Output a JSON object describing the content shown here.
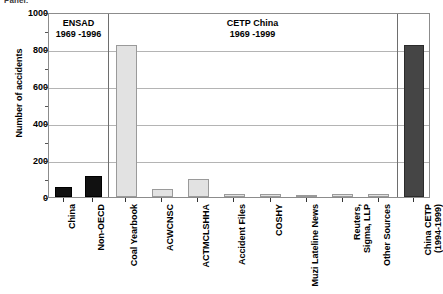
{
  "figure": {
    "top_fragment": "Panel:",
    "y_axis_title": "Number of accidents",
    "panels": [
      {
        "id": "ensad",
        "line1": "ENSAD",
        "line2": "1969 -1996"
      },
      {
        "id": "cetp-china",
        "line1": "CETP China",
        "line2": "1969 -1999"
      },
      {
        "id": "china-cetp",
        "line1": "",
        "line2": ""
      }
    ],
    "y_ticks": [
      "0",
      "200",
      "400",
      "600",
      "800",
      "1000"
    ]
  },
  "chart_data": {
    "type": "bar",
    "title": "",
    "xlabel": "",
    "ylabel": "Number of accidents",
    "ylim": [
      0,
      1000
    ],
    "yticks": [
      0,
      200,
      400,
      600,
      800,
      1000
    ],
    "grid": true,
    "legend": "none",
    "panel_dividers": [
      "ENSAD 1969 -1996 | CETP China 1969 -1999",
      "CETP China 1969 -1999 | China CETP (1994-1999)"
    ],
    "categories": [
      "China",
      "Non-OECD",
      "Coal Yearbook",
      "ACWCNSC",
      "ACTMCLSHHA",
      "Accident Files",
      "COSHY",
      "Muzi Lateline News",
      "Reuters, Sigma, LLP",
      "Other Sources",
      "China CETP (1994-1999)"
    ],
    "values": [
      52,
      112,
      820,
      45,
      100,
      18,
      16,
      6,
      16,
      14,
      820
    ],
    "bar_styles": [
      "black",
      "black",
      "light",
      "light",
      "light",
      "light",
      "light",
      "light",
      "light",
      "light",
      "dark"
    ],
    "groups": [
      {
        "name": "ENSAD 1969 -1996",
        "categories": [
          "China",
          "Non-OECD"
        ]
      },
      {
        "name": "CETP China 1969 -1999",
        "categories": [
          "Coal Yearbook",
          "ACWCNSC",
          "ACTMCLSHHA",
          "Accident Files",
          "COSHY",
          "Muzi Lateline News",
          "Reuters, Sigma, LLP",
          "Other Sources"
        ]
      },
      {
        "name": "China CETP (1994-1999)",
        "categories": [
          "China CETP (1994-1999)"
        ]
      }
    ],
    "x_tick_labels": [
      {
        "line1": "China",
        "line2": ""
      },
      {
        "line1": "Non-OECD",
        "line2": ""
      },
      {
        "line1": "Coal Yearbook",
        "line2": ""
      },
      {
        "line1": "ACWCNSC",
        "line2": ""
      },
      {
        "line1": "ACTMCLSHHA",
        "line2": ""
      },
      {
        "line1": "Accident Files",
        "line2": ""
      },
      {
        "line1": "COSHY",
        "line2": ""
      },
      {
        "line1": "Muzi Lateline News",
        "line2": ""
      },
      {
        "line1": "Reuters,",
        "line2": "Sigma, LLP"
      },
      {
        "line1": "Other Sources",
        "line2": ""
      },
      {
        "line1": "China CETP",
        "line2": "(1994-1999)"
      }
    ],
    "colors": {
      "black_bar": "#111111",
      "light_bar": "#e2e2e2",
      "dark_bar": "#454545",
      "gridline": "#b4b4b4",
      "frame": "#8c8c8c"
    }
  }
}
